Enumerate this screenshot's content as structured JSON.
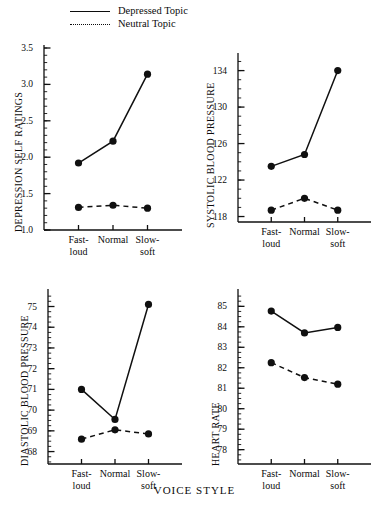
{
  "figure": {
    "xlabel": "VOICE STYLE",
    "legend": [
      {
        "label": "Depressed Topic",
        "style": "solid",
        "key": "legend-key-depressed"
      },
      {
        "label": "Neutral Topic",
        "style": "dotted",
        "key": "legend-key-neutral"
      }
    ]
  },
  "chart_data": [
    {
      "type": "line",
      "title": "",
      "xlabel": "VOICE STYLE",
      "ylabel": "DEPRESSION SELF RATINGS",
      "categories": [
        "Fast-\nloud",
        "Normal",
        "Slow-\nsoft"
      ],
      "ylim": [
        1.0,
        3.5
      ],
      "yticks": [
        1.0,
        1.5,
        2.0,
        2.5,
        3.0,
        3.5
      ],
      "ytick_labels": [
        "1.0",
        "1.5",
        "2.0",
        "2.5",
        "3.0",
        "3.5"
      ],
      "minor_tick_step": 0.1,
      "grid": false,
      "legend_position": "top",
      "series": [
        {
          "name": "Depressed Topic",
          "style": "solid",
          "values": [
            1.92,
            2.22,
            3.14
          ]
        },
        {
          "name": "Neutral Topic",
          "style": "dashed",
          "values": [
            1.31,
            1.34,
            1.3
          ]
        }
      ]
    },
    {
      "type": "line",
      "title": "",
      "xlabel": "VOICE STYLE",
      "ylabel": "SYSTOLIC BLOOD PRESSURE",
      "categories": [
        "Fast-\nloud",
        "Normal",
        "Slow-\nsoft"
      ],
      "ylim": [
        117.4,
        135.6
      ],
      "yticks": [
        118,
        122,
        126,
        130,
        134
      ],
      "ytick_labels": [
        "118",
        "122",
        "126",
        "130",
        "134"
      ],
      "minor_tick_step": 1,
      "grid": false,
      "legend_position": "top",
      "series": [
        {
          "name": "Depressed Topic",
          "style": "solid",
          "values": [
            123.5,
            124.8,
            134.0
          ]
        },
        {
          "name": "Neutral Topic",
          "style": "dashed",
          "values": [
            118.7,
            120.0,
            118.7
          ]
        }
      ]
    },
    {
      "type": "line",
      "title": "",
      "xlabel": "VOICE STYLE",
      "ylabel": "DIASTOLIC BLOOD PRESSURE",
      "categories": [
        "Fast-\nloud",
        "Normal",
        "Slow-\nsoft"
      ],
      "ylim": [
        67.4,
        75.7
      ],
      "yticks": [
        68,
        69,
        70,
        71,
        72,
        73,
        74,
        75
      ],
      "ytick_labels": [
        "68",
        "69",
        "70",
        "71",
        "72",
        "73",
        "74",
        "75"
      ],
      "minor_tick_step": 0.25,
      "grid": false,
      "legend_position": "top",
      "series": [
        {
          "name": "Depressed Topic",
          "style": "solid",
          "values": [
            71.0,
            69.55,
            75.1
          ]
        },
        {
          "name": "Neutral Topic",
          "style": "dashed",
          "values": [
            68.6,
            69.05,
            68.85
          ]
        }
      ]
    },
    {
      "type": "line",
      "title": "",
      "xlabel": "VOICE STYLE",
      "ylabel": "HEART RATE",
      "categories": [
        "Fast-\nloud",
        "Normal",
        "Slow-\nsoft"
      ],
      "ylim": [
        77.3,
        85.7
      ],
      "yticks": [
        78,
        79,
        80,
        81,
        82,
        83,
        84,
        85
      ],
      "ytick_labels": [
        "78",
        "79",
        "80",
        "81",
        "82",
        "83",
        "84",
        "85"
      ],
      "minor_tick_step": 0.25,
      "grid": false,
      "legend_position": "top",
      "series": [
        {
          "name": "Depressed Topic",
          "style": "solid",
          "values": [
            84.77,
            83.7,
            83.97
          ]
        },
        {
          "name": "Neutral Topic",
          "style": "dashed",
          "values": [
            82.25,
            81.52,
            81.2
          ]
        }
      ]
    }
  ]
}
